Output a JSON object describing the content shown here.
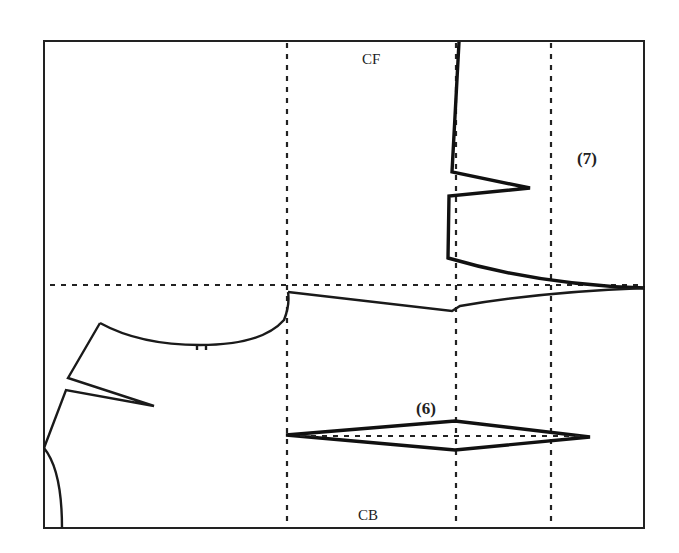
{
  "diagram": {
    "labels": {
      "cf": "CF",
      "cb": "CB",
      "step6": "(6)",
      "step7": "(7)"
    },
    "colors": {
      "line": "#1a1a1a",
      "background": "#ffffff"
    },
    "elements": [
      "outer-frame",
      "vertical-guide-lines (3, dashed)",
      "horizontal-guide-line (dashed)",
      "center-front-line-with-dart",
      "waist-line",
      "armhole-curve",
      "shoulder-dart",
      "neckline-curve",
      "diamond-dart (6)"
    ]
  }
}
